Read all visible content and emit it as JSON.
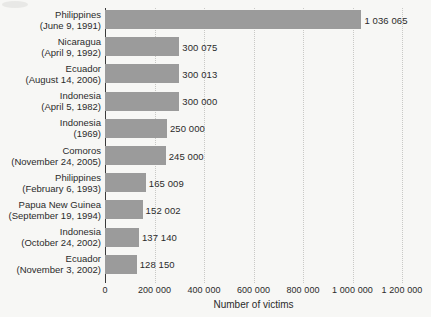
{
  "chart_data": {
    "type": "bar",
    "orientation": "horizontal",
    "title": "",
    "xlabel": "Number of victims",
    "ylabel": "",
    "xlim": [
      0,
      1200000
    ],
    "grid": true,
    "legend": false,
    "xticks": [
      {
        "value": 0,
        "label": "0"
      },
      {
        "value": 200000,
        "label": "200 000"
      },
      {
        "value": 400000,
        "label": "400 000"
      },
      {
        "value": 600000,
        "label": "600 000"
      },
      {
        "value": 800000,
        "label": "800 000"
      },
      {
        "value": 1000000,
        "label": "1 000 000"
      },
      {
        "value": 1200000,
        "label": "1 200 000"
      }
    ],
    "bar_color": "#9b9b9b",
    "categories": [
      "Philippines (June 9, 1991)",
      "Nicaragua (April 9, 1992)",
      "Ecuador (August 14, 2006)",
      "Indonesia (April 5, 1982)",
      "Indonesia (1969)",
      "Comoros (November 24, 2005)",
      "Philippines (February 6, 1993)",
      "Papua New Guinea (September 19, 1994)",
      "Indonesia (October 24, 2002)",
      "Ecuador (November 3, 2002)"
    ],
    "values": [
      1036065,
      300075,
      300013,
      300000,
      250000,
      245000,
      165009,
      152002,
      137140,
      128150
    ],
    "value_labels": [
      "1 036 065",
      "300 075",
      "300 013",
      "300 000",
      "250 000",
      "245 000",
      "165 009",
      "152 002",
      "137 140",
      "128 150"
    ],
    "rows": [
      {
        "name": "Philippines",
        "date": "(June 9, 1991)",
        "value": 1036065,
        "label": "1 036 065"
      },
      {
        "name": "Nicaragua",
        "date": "(April 9, 1992)",
        "value": 300075,
        "label": "300 075"
      },
      {
        "name": "Ecuador",
        "date": "(August 14, 2006)",
        "value": 300013,
        "label": "300 013"
      },
      {
        "name": "Indonesia",
        "date": "(April 5, 1982)",
        "value": 300000,
        "label": "300 000"
      },
      {
        "name": "Indonesia",
        "date": "(1969)",
        "value": 250000,
        "label": "250 000"
      },
      {
        "name": "Comoros",
        "date": "(November 24, 2005)",
        "value": 245000,
        "label": "245 000"
      },
      {
        "name": "Philippines",
        "date": "(February 6, 1993)",
        "value": 165009,
        "label": "165 009"
      },
      {
        "name": "Papua New Guinea",
        "date": "(September 19, 1994)",
        "value": 152002,
        "label": "152 002"
      },
      {
        "name": "Indonesia",
        "date": "(October 24, 2002)",
        "value": 137140,
        "label": "137 140"
      },
      {
        "name": "Ecuador",
        "date": "(November 3, 2002)",
        "value": 128150,
        "label": "128 150"
      }
    ]
  }
}
